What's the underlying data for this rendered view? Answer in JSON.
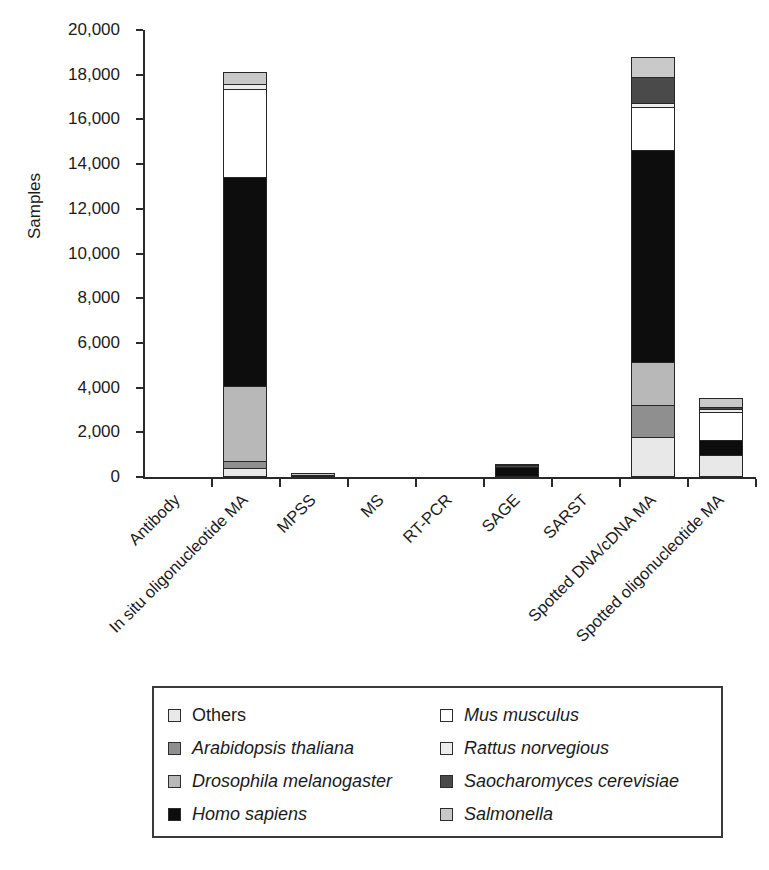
{
  "chart_data": {
    "type": "bar",
    "subtype": "stacked",
    "title": "",
    "xlabel": "",
    "ylabel": "Samples",
    "ylim": [
      0,
      20000
    ],
    "yticks": [
      0,
      2000,
      4000,
      6000,
      8000,
      10000,
      12000,
      14000,
      16000,
      18000,
      20000
    ],
    "ytick_labels": [
      "0",
      "2,000",
      "4,000",
      "6,000",
      "8,000",
      "10,000",
      "12,000",
      "14,000",
      "16,000",
      "18,000",
      "20,000"
    ],
    "grid": false,
    "legend_position": "bottom",
    "categories": [
      "Antibody",
      "In situ oligonucleotide MA",
      "MPSS",
      "MS",
      "RT-PCR",
      "SAGE",
      "SARST",
      "Spotted DNA/cDNA MA",
      "Spotted oligonucleotide MA"
    ],
    "series": [
      {
        "name": "Others",
        "color": "#e8e8e8",
        "values": [
          0,
          400,
          0,
          0,
          0,
          0,
          0,
          1800,
          1000
        ]
      },
      {
        "name": "Arabidopsis thaliana",
        "color": "#8f8f8f",
        "values": [
          0,
          350,
          0,
          0,
          0,
          0,
          0,
          1450,
          0
        ]
      },
      {
        "name": "Drosophila melanogaster",
        "color": "#b8b8b8",
        "values": [
          0,
          3400,
          0,
          0,
          0,
          0,
          0,
          2000,
          0
        ]
      },
      {
        "name": "Homo sapiens",
        "color": "#0d0d0d",
        "values": [
          0,
          9400,
          100,
          0,
          0,
          450,
          0,
          9500,
          700
        ]
      },
      {
        "name": "Mus musculus",
        "color": "#ffffff",
        "values": [
          0,
          4000,
          0,
          0,
          0,
          0,
          0,
          2000,
          1300
        ]
      },
      {
        "name": "Rattus norvegious",
        "color": "#ededed",
        "values": [
          0,
          250,
          0,
          0,
          0,
          0,
          0,
          200,
          200
        ]
      },
      {
        "name": "Saocharomyces cerevisiae",
        "color": "#4a4a4a",
        "values": [
          0,
          0,
          0,
          0,
          0,
          80,
          0,
          1200,
          100
        ]
      },
      {
        "name": "Salmonella",
        "color": "#c9c9c9",
        "values": [
          0,
          600,
          50,
          0,
          0,
          70,
          0,
          950,
          450
        ]
      }
    ],
    "totals": [
      0,
      18100,
      150,
      0,
      0,
      600,
      0,
      18000,
      3700
    ]
  },
  "axes": {
    "y_title": "Samples",
    "y_tick_labels": [
      "20,000",
      "18,000",
      "16,000",
      "14,000",
      "12,000",
      "10,000",
      "8,000",
      "6,000",
      "4,000",
      "2,000",
      "0"
    ],
    "x_tick_labels": [
      "Antibody",
      "In situ oligonucleotide MA",
      "MPSS",
      "MS",
      "RT-PCR",
      "SAGE",
      "SARST",
      "Spotted DNA/cDNA MA",
      "Spotted oligonucleotide MA"
    ]
  },
  "legend": {
    "entries": [
      {
        "label": "Others",
        "color": "#e8e8e8",
        "italic": false
      },
      {
        "label": "Mus musculus",
        "color": "#ffffff",
        "italic": true
      },
      {
        "label": "Arabidopsis thaliana",
        "color": "#8f8f8f",
        "italic": true
      },
      {
        "label": "Rattus norvegious",
        "color": "#ededed",
        "italic": true
      },
      {
        "label": "Drosophila melanogaster",
        "color": "#b8b8b8",
        "italic": true
      },
      {
        "label": "Saocharomyces cerevisiae",
        "color": "#4a4a4a",
        "italic": true
      },
      {
        "label": "Homo sapiens",
        "color": "#0d0d0d",
        "italic": true
      },
      {
        "label": "Salmonella",
        "color": "#c9c9c9",
        "italic": true
      }
    ]
  }
}
